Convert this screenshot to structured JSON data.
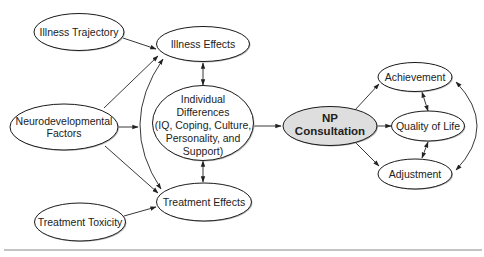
{
  "diagram": {
    "type": "flow-model",
    "colors": {
      "node_fill": "#ffffff",
      "highlight_fill": "#dedede",
      "stroke": "#1a1a1a",
      "shadow": "#bbbbbb",
      "rule": "#888888"
    },
    "nodes": {
      "illness_trajectory": {
        "lines": [
          "Illness Trajectory"
        ]
      },
      "neurodevelopmental_factors": {
        "lines": [
          "Neurodevelopmental",
          "Factors"
        ]
      },
      "treatment_toxicity": {
        "lines": [
          "Treatment Toxicity"
        ]
      },
      "illness_effects": {
        "lines": [
          "Illness Effects"
        ]
      },
      "individual_differences": {
        "lines": [
          "Individual",
          "Differences",
          "(IQ, Coping, Culture,",
          "Personality, and",
          "Support)"
        ]
      },
      "treatment_effects": {
        "lines": [
          "Treatment Effects"
        ]
      },
      "np_consultation": {
        "lines": [
          "NP",
          "Consultation"
        ],
        "highlighted": true
      },
      "achievement": {
        "lines": [
          "Achievement"
        ]
      },
      "quality_of_life": {
        "lines": [
          "Quality of Life"
        ]
      },
      "adjustment": {
        "lines": [
          "Adjustment"
        ]
      }
    },
    "edges": [
      {
        "from": "Illness Trajectory",
        "to": "Illness Effects",
        "type": "arrow"
      },
      {
        "from": "Neurodevelopmental Factors",
        "to": "Illness Effects",
        "type": "arrow"
      },
      {
        "from": "Neurodevelopmental Factors",
        "to": "Individual Differences",
        "type": "arrow"
      },
      {
        "from": "Neurodevelopmental Factors",
        "to": "Treatment Effects",
        "type": "arrow"
      },
      {
        "from": "Treatment Toxicity",
        "to": "Treatment Effects",
        "type": "arrow"
      },
      {
        "from": "Illness Effects",
        "to": "Treatment Effects",
        "type": "curved-double-arrow"
      },
      {
        "from": "Illness Effects",
        "to": "Individual Differences",
        "type": "double-arrow"
      },
      {
        "from": "Individual Differences",
        "to": "Treatment Effects",
        "type": "double-arrow"
      },
      {
        "from": "Individual Differences",
        "to": "NP Consultation",
        "type": "arrow"
      },
      {
        "from": "NP Consultation",
        "to": "Achievement",
        "type": "arrow"
      },
      {
        "from": "NP Consultation",
        "to": "Quality of Life",
        "type": "arrow"
      },
      {
        "from": "NP Consultation",
        "to": "Adjustment",
        "type": "arrow"
      },
      {
        "from": "Achievement",
        "to": "Quality of Life",
        "type": "double-arrow"
      },
      {
        "from": "Quality of Life",
        "to": "Adjustment",
        "type": "double-arrow"
      },
      {
        "from": "Achievement",
        "to": "Adjustment",
        "type": "curved-double-arrow"
      }
    ]
  }
}
